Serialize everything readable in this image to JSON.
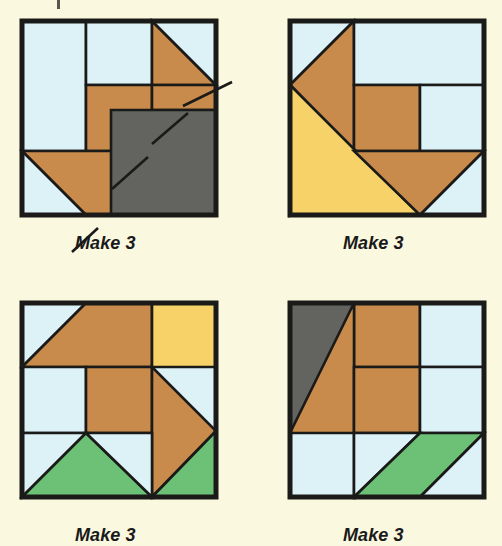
{
  "page": {
    "background_color": "#fbf8e0",
    "width": 502,
    "height": 546,
    "partial_crop_mark": true
  },
  "palette": {
    "background": "#fbf8e0",
    "light_blue": "#ddf2f7",
    "orange": "#c98b4b",
    "yellow": "#f6d269",
    "green": "#6cc176",
    "gray": "#63635f",
    "outline": "#1a1a18"
  },
  "legend": {
    "color_names": {
      "light_blue": "background fabric",
      "orange": "medium orange fabric",
      "yellow": "gold fabric",
      "green": "green fabric",
      "gray": "dark gray fabric"
    }
  },
  "blocks": [
    {
      "id": "block-1",
      "position": "top-left",
      "caption": "Make 3",
      "caption_x": 75,
      "caption_y": 233,
      "x": 22,
      "y": 21,
      "size": 194,
      "has_leader_lines": true,
      "leader_lines": [
        {
          "name": "upper-leader-line",
          "x1": 183,
          "y1": 106,
          "x2": 232,
          "y2": 82
        },
        {
          "name": "inner-upper-leader-line",
          "x1": 152,
          "y1": 144,
          "x2": 188,
          "y2": 113
        },
        {
          "name": "inner-lower-leader-line",
          "x1": 112,
          "y1": 189,
          "x2": 148,
          "y2": 157
        },
        {
          "name": "lower-leader-line",
          "x1": 98,
          "y1": 228,
          "x2": 72,
          "y2": 252
        }
      ],
      "shapes": [
        {
          "name": "left-background-rect",
          "fill": "light_blue",
          "points": "0,0 64,0 64,130 0,130"
        },
        {
          "name": "top-center-background-rect",
          "fill": "light_blue",
          "points": "64,0 130,0 130,64 64,64"
        },
        {
          "name": "top-right-orange-triangle",
          "fill": "orange",
          "points": "130,0 194,64 130,64"
        },
        {
          "name": "top-right-background-triangle",
          "fill": "light_blue",
          "points": "130,0 194,0 194,64"
        },
        {
          "name": "center-orange-column",
          "fill": "orange",
          "points": "64,64 130,64 130,130 64,130"
        },
        {
          "name": "right-orange-strip",
          "fill": "orange",
          "points": "130,64 194,64 194,89 130,89"
        },
        {
          "name": "lower-left-orange-triangle",
          "fill": "orange",
          "points": "0,130 130,130 130,194 64,194"
        },
        {
          "name": "lower-left-background-triangle",
          "fill": "light_blue",
          "points": "0,130 64,194 0,194"
        },
        {
          "name": "gray-square-overlay",
          "fill": "gray",
          "points": "89,89 194,89 194,194 89,194"
        }
      ]
    },
    {
      "id": "block-2",
      "position": "top-right",
      "caption": "Make 3",
      "caption_x": 343,
      "caption_y": 233,
      "x": 290,
      "y": 21,
      "size": 194,
      "has_leader_lines": false,
      "leader_lines": [],
      "shapes": [
        {
          "name": "top-left-background-triangle",
          "fill": "light_blue",
          "points": "0,0 64,0 0,64"
        },
        {
          "name": "large-orange-arrow",
          "fill": "orange",
          "points": "64,0 64,130 0,64"
        },
        {
          "name": "orange-arrow-lower-wing",
          "fill": "orange",
          "points": "0,64 64,130 0,194"
        },
        {
          "name": "top-right-background-rect",
          "fill": "light_blue",
          "points": "64,0 194,0 194,64 64,64"
        },
        {
          "name": "center-orange-square",
          "fill": "orange",
          "points": "64,64 130,64 130,130 64,130"
        },
        {
          "name": "right-background-rect",
          "fill": "light_blue",
          "points": "130,64 194,64 194,130 130,130"
        },
        {
          "name": "yellow-corner-triangle",
          "fill": "yellow",
          "points": "0,64 130,194 0,194"
        },
        {
          "name": "bottom-orange-chevron",
          "fill": "orange",
          "points": "64,130 194,130 130,194"
        },
        {
          "name": "bottom-right-background-triangle",
          "fill": "light_blue",
          "points": "194,130 194,194 130,194"
        }
      ]
    },
    {
      "id": "block-3",
      "position": "bottom-left",
      "caption": "Make 3",
      "caption_x": 75,
      "caption_y": 525,
      "x": 22,
      "y": 303,
      "size": 194,
      "has_leader_lines": false,
      "leader_lines": [],
      "shapes": [
        {
          "name": "top-left-background-triangle",
          "fill": "light_blue",
          "points": "0,0 64,0 0,64"
        },
        {
          "name": "top-orange-roof-triangle",
          "fill": "orange",
          "points": "64,0 130,0 130,64 0,64"
        },
        {
          "name": "top-right-yellow-triangle",
          "fill": "yellow",
          "points": "130,0 194,0 194,64 130,64"
        },
        {
          "name": "left-background-square",
          "fill": "light_blue",
          "points": "0,64 64,64 64,130 0,130"
        },
        {
          "name": "center-orange-square",
          "fill": "orange",
          "points": "64,64 130,64 130,130 64,130"
        },
        {
          "name": "right-orange-diamond",
          "fill": "orange",
          "points": "130,64 194,128 130,194 130,64"
        },
        {
          "name": "bottom-left-background-triangle",
          "fill": "light_blue",
          "points": "0,130 64,130 0,194"
        },
        {
          "name": "bottom-left-green-triangle",
          "fill": "green",
          "points": "64,130 130,194 0,194"
        },
        {
          "name": "bottom-center-background-triangle",
          "fill": "light_blue",
          "points": "64,130 130,130 130,194"
        },
        {
          "name": "bottom-right-green-triangle",
          "fill": "green",
          "points": "130,194 194,128 194,194"
        }
      ]
    },
    {
      "id": "block-4",
      "position": "bottom-right",
      "caption": "Make 3",
      "caption_x": 343,
      "caption_y": 525,
      "x": 290,
      "y": 303,
      "size": 194,
      "has_leader_lines": false,
      "leader_lines": [],
      "shapes": [
        {
          "name": "top-left-gray-triangle",
          "fill": "gray",
          "points": "0,0 64,0 64,64 0,130"
        },
        {
          "name": "top-orange-roof-triangle",
          "fill": "orange",
          "points": "64,0 130,0 130,64 64,64"
        },
        {
          "name": "top-right-background-triangle",
          "fill": "light_blue",
          "points": "130,0 194,0 194,64 130,64"
        },
        {
          "name": "left-orange-diamond",
          "fill": "orange",
          "points": "64,0 64,194 0,130"
        },
        {
          "name": "center-orange-square",
          "fill": "orange",
          "points": "64,64 130,64 130,130 64,130"
        },
        {
          "name": "right-background-square",
          "fill": "light_blue",
          "points": "130,64 194,64 194,130 130,130"
        },
        {
          "name": "bottom-left-background-triangle",
          "fill": "light_blue",
          "points": "0,130 64,130 64,194 0,194"
        },
        {
          "name": "bottom-center-background-triangle",
          "fill": "light_blue",
          "points": "64,130 130,130 64,194"
        },
        {
          "name": "bottom-right-green-parallelogram",
          "fill": "green",
          "points": "130,130 194,130 130,194 64,194"
        },
        {
          "name": "bottom-right-background-triangle",
          "fill": "light_blue",
          "points": "194,130 194,194 130,194"
        }
      ]
    }
  ]
}
